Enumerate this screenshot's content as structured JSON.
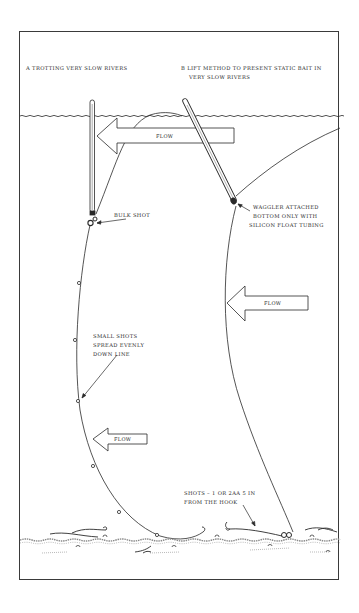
{
  "diagram": {
    "panel_a": {
      "title": "A  TROTTING VERY SLOW RIVERS",
      "annotations": {
        "bulk_shot": "BULK SHOT",
        "small_shots": [
          "SMALL SHOTS",
          "SPREAD EVENLY",
          "DOWN LINE"
        ]
      },
      "flow_labels": [
        "FLOW",
        "FLOW"
      ]
    },
    "panel_b": {
      "title_line1": "B  LIFT METHOD TO PRESENT STATIC BAIT IN",
      "title_line2": "VERY SLOW RIVERS",
      "annotations": {
        "waggler": [
          "WAGGLER ATTACHED",
          "BOTTOM ONLY WITH",
          "SILICON FLOAT TUBING"
        ],
        "shots": [
          "SHOTS – 1 OR 2AA 5 IN",
          "FROM THE HOOK"
        ]
      },
      "flow_label": "FLOW"
    },
    "colors": {
      "ink": "#2a2a2a",
      "background": "#ffffff",
      "riverbed": "#8a8a8a"
    }
  }
}
